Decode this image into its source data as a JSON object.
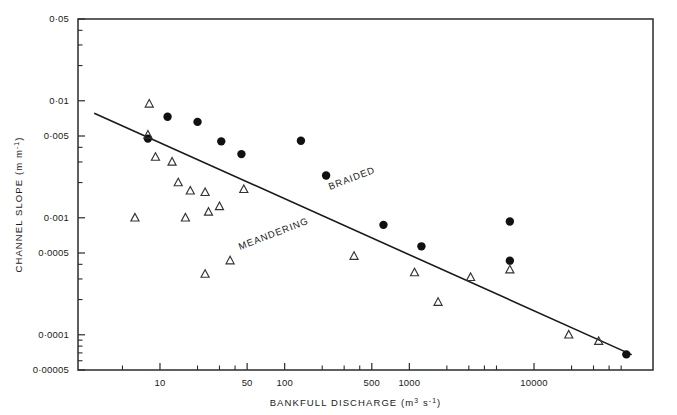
{
  "chart_data": {
    "type": "scatter",
    "title": "",
    "xlabel": "BANKFULL DISCHARGE (m3 s-1)",
    "xlabel_parts": {
      "text": "BANKFULL  DISCHARGE",
      "unit_base": "(m",
      "unit_sup1": "3",
      "unit_mid": " s",
      "unit_sup2": "-1",
      "unit_close": ")"
    },
    "ylabel": "CHANNEL SLOPE (m m-1)",
    "ylabel_parts": {
      "text": "CHANNEL  SLOPE",
      "unit_base": "(m m",
      "unit_sup": "-1",
      "unit_close": ")"
    },
    "xscale": "log",
    "yscale": "log",
    "xlim": [
      2.2,
      90000
    ],
    "ylim": [
      5e-05,
      0.05
    ],
    "grid": false,
    "legend": "none",
    "xticks": [
      {
        "value": 10,
        "label": "10",
        "major": true
      },
      {
        "value": 50,
        "label": "50",
        "major": true
      },
      {
        "value": 100,
        "label": "100",
        "major": true
      },
      {
        "value": 500,
        "label": "500",
        "major": true
      },
      {
        "value": 1000,
        "label": "1000",
        "major": true
      },
      {
        "value": 10000,
        "label": "10000",
        "major": true
      }
    ],
    "xticks_minor": [
      5,
      20,
      30,
      40,
      200,
      300,
      400,
      2000,
      3000,
      4000,
      5000,
      20000,
      30000,
      40000,
      50000
    ],
    "yticks": [
      {
        "value": 0.05,
        "label": "0·05",
        "major": true
      },
      {
        "value": 0.01,
        "label": "0·01",
        "major": true
      },
      {
        "value": 0.005,
        "label": "0·005",
        "major": true
      },
      {
        "value": 0.001,
        "label": "0·001",
        "major": true
      },
      {
        "value": 0.0005,
        "label": "0·0005",
        "major": true
      },
      {
        "value": 0.0001,
        "label": "0·0001",
        "major": true
      },
      {
        "value": 5e-05,
        "label": "0·00005",
        "major": true
      }
    ],
    "yticks_minor": [
      0.04,
      0.03,
      0.02,
      0.004,
      0.003,
      0.002,
      0.0004,
      0.0003,
      0.0002,
      9e-05,
      8e-05,
      7e-05,
      6e-05
    ],
    "annotations": [
      {
        "text": "BRAIDED",
        "x": 330,
        "y": 190,
        "rotation": -21
      },
      {
        "text": "MEANDERING",
        "x": 240,
        "y": 250,
        "rotation": -21
      }
    ],
    "trendline": {
      "name": "braided-meandering threshold",
      "x1": 3.0,
      "y1": 0.0078,
      "x2": 60000,
      "y2": 6.8e-05
    },
    "series": [
      {
        "name": "BRAIDED",
        "marker": "filled-circle",
        "color": "#111111",
        "points": [
          {
            "x": 8.0,
            "y": 0.00475
          },
          {
            "x": 11.5,
            "y": 0.0073
          },
          {
            "x": 20.0,
            "y": 0.0066
          },
          {
            "x": 31.0,
            "y": 0.0045
          },
          {
            "x": 45.0,
            "y": 0.0035
          },
          {
            "x": 135.0,
            "y": 0.00455
          },
          {
            "x": 215.0,
            "y": 0.0023
          },
          {
            "x": 620.0,
            "y": 0.00087
          },
          {
            "x": 1250.0,
            "y": 0.00057
          },
          {
            "x": 6400.0,
            "y": 0.00093
          },
          {
            "x": 6400.0,
            "y": 0.00043
          },
          {
            "x": 55000.0,
            "y": 6.8e-05
          }
        ]
      },
      {
        "name": "MEANDERING",
        "marker": "open-triangle",
        "color": "#333333",
        "points": [
          {
            "x": 8.2,
            "y": 0.0094
          },
          {
            "x": 8.0,
            "y": 0.0051
          },
          {
            "x": 9.2,
            "y": 0.0033
          },
          {
            "x": 12.5,
            "y": 0.003
          },
          {
            "x": 14.0,
            "y": 0.002
          },
          {
            "x": 17.5,
            "y": 0.0017
          },
          {
            "x": 23.0,
            "y": 0.00165
          },
          {
            "x": 30.0,
            "y": 0.00125
          },
          {
            "x": 47.0,
            "y": 0.00175
          },
          {
            "x": 6.3,
            "y": 0.001
          },
          {
            "x": 16.0,
            "y": 0.001
          },
          {
            "x": 24.5,
            "y": 0.00112
          },
          {
            "x": 36.5,
            "y": 0.00043
          },
          {
            "x": 23.0,
            "y": 0.00033
          },
          {
            "x": 360.0,
            "y": 0.00047
          },
          {
            "x": 1100.0,
            "y": 0.00034
          },
          {
            "x": 1700.0,
            "y": 0.00019
          },
          {
            "x": 6400.0,
            "y": 0.00036
          },
          {
            "x": 3100.0,
            "y": 0.00031
          },
          {
            "x": 19000.0,
            "y": 0.0001
          },
          {
            "x": 33000.0,
            "y": 8.8e-05
          }
        ]
      }
    ]
  }
}
